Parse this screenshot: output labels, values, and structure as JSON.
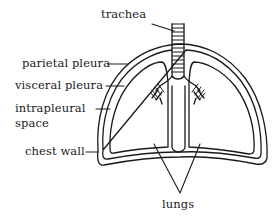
{
  "diagram": {
    "colors": {
      "ink": "#1a1a1a",
      "background": "#ffffff"
    },
    "labels": {
      "trachea": "trachea",
      "parietal_pleura": "parietal pleura",
      "visceral_pleura": "visceral pleura",
      "intrapleural_line1": "intrapleural",
      "intrapleural_line2": "space",
      "chest_wall": "chest wall",
      "lungs": "lungs"
    }
  }
}
